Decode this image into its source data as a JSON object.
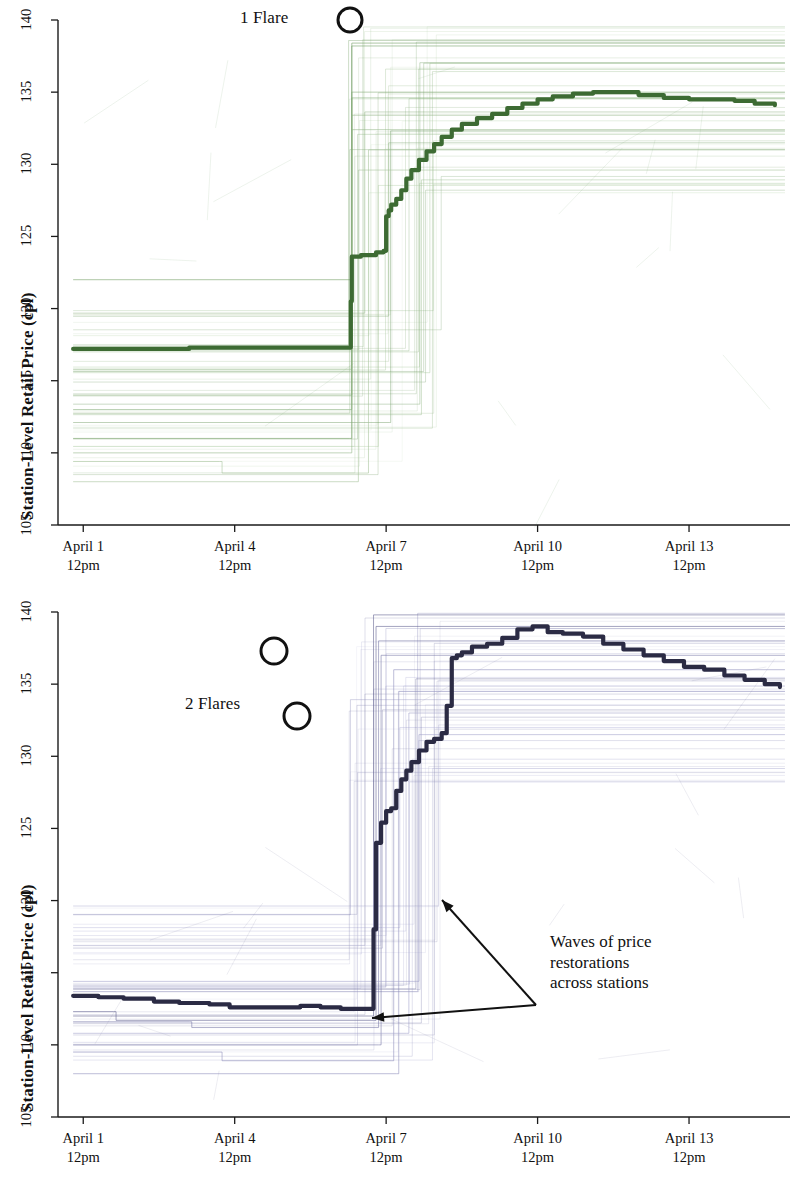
{
  "figure": {
    "background": "#ffffff",
    "panel_count": 2
  },
  "axis": {
    "y_label": "Station-Level Retail Price (cpl)",
    "y_ticks": [
      "105",
      "110",
      "115",
      "120",
      "125",
      "130",
      "135",
      "140"
    ],
    "x_ticks": [
      {
        "date": "April 1",
        "time": "12pm"
      },
      {
        "date": "April 4",
        "time": "12pm"
      },
      {
        "date": "April 7",
        "time": "12pm"
      },
      {
        "date": "April 10",
        "time": "12pm"
      },
      {
        "date": "April 13",
        "time": "12pm"
      }
    ]
  },
  "panel_top": {
    "annotation_flare": "1 Flare",
    "accent_color": "#3d6b33"
  },
  "panel_bottom": {
    "annotation_flare": "2 Flares",
    "annotation_waves_line1": "Waves of price",
    "annotation_waves_line2": "restorations",
    "annotation_waves_line3": "across stations",
    "accent_color": "#2b2b44"
  },
  "chart_data": [
    {
      "type": "line",
      "panel": "top",
      "title": "",
      "xlabel": "",
      "ylabel": "Station-Level Retail Price (cpl)",
      "ylim": [
        105,
        140
      ],
      "xlim": [
        0,
        14.5
      ],
      "x_tick_values": [
        0.5,
        3.5,
        6.5,
        9.5,
        12.5
      ],
      "x_tick_labels": [
        "April 1 12pm",
        "April 4 12pm",
        "April 7 12pm",
        "April 10 12pm",
        "April 13 12pm"
      ],
      "grid": false,
      "legend": null,
      "annotations": [
        {
          "text": "1 Flare",
          "x": 5.0,
          "y": 140.0
        },
        {
          "text": "flare-circle-marker",
          "x": 6.1,
          "y": 139.8
        }
      ],
      "series": [
        {
          "name": "Average station-level retail price (bold green)",
          "color": "#3d6b33",
          "x": [
            0.3,
            1.0,
            2.0,
            2.6,
            3.0,
            4.0,
            5.0,
            5.75,
            5.8,
            5.82,
            6.0,
            6.3,
            6.45,
            6.5,
            6.55,
            6.6,
            6.7,
            6.8,
            6.9,
            7.0,
            7.15,
            7.3,
            7.45,
            7.6,
            7.8,
            8.0,
            8.3,
            8.6,
            8.9,
            9.2,
            9.5,
            9.8,
            10.2,
            10.6,
            11.0,
            11.5,
            12.0,
            12.5,
            13.0,
            13.4,
            13.8,
            14.2
          ],
          "y": [
            117.2,
            117.2,
            117.2,
            117.3,
            117.3,
            117.3,
            117.3,
            117.3,
            120.5,
            123.6,
            123.7,
            123.9,
            124.0,
            126.4,
            126.8,
            127.2,
            127.6,
            128.2,
            129.0,
            129.6,
            130.3,
            130.9,
            131.4,
            131.9,
            132.4,
            132.8,
            133.2,
            133.5,
            133.9,
            134.2,
            134.5,
            134.7,
            134.9,
            135.0,
            135.0,
            134.8,
            134.6,
            134.5,
            134.5,
            134.4,
            134.2,
            134.1
          ]
        },
        {
          "name": "station spaghetti 1",
          "color": "#6b9a5c",
          "x": [
            0.3,
            5.78,
            5.82,
            14.4
          ],
          "y": [
            122.0,
            122.0,
            138.4,
            138.4
          ]
        },
        {
          "name": "station spaghetti 2",
          "color": "#6b9a5c",
          "x": [
            0.3,
            5.78,
            5.82,
            14.4
          ],
          "y": [
            111.0,
            111.0,
            138.2,
            138.2
          ]
        },
        {
          "name": "station spaghetti 3",
          "color": "#7fa872",
          "x": [
            0.3,
            5.78,
            5.82,
            14.4
          ],
          "y": [
            114.0,
            114.0,
            135.0,
            135.0
          ]
        },
        {
          "name": "station spaghetti 4",
          "color": "#7fa872",
          "x": [
            0.3,
            5.78,
            5.82,
            14.4
          ],
          "y": [
            113.0,
            113.0,
            134.6,
            134.6
          ]
        },
        {
          "name": "station spaghetti 5",
          "color": "#8fb382",
          "x": [
            0.3,
            5.78,
            5.82,
            14.4
          ],
          "y": [
            115.8,
            115.8,
            133.4,
            133.4
          ]
        },
        {
          "name": "station spaghetti 6",
          "color": "#8fb382",
          "x": [
            0.3,
            5.78,
            5.82,
            14.4
          ],
          "y": [
            110.0,
            110.0,
            132.4,
            132.4
          ]
        },
        {
          "name": "station spaghetti 7",
          "color": "#a3c097",
          "x": [
            0.3,
            3.2,
            3.25,
            6.1,
            6.15,
            14.4
          ],
          "y": [
            109.4,
            109.4,
            108.6,
            108.6,
            131.0,
            131.0
          ]
        },
        {
          "name": "station spaghetti 8",
          "color": "#a3c097",
          "x": [
            0.3,
            5.9,
            5.95,
            14.4
          ],
          "y": [
            108.0,
            108.0,
            129.6,
            129.6
          ]
        }
      ]
    },
    {
      "type": "line",
      "panel": "bottom",
      "title": "",
      "xlabel": "",
      "ylabel": "Station-Level Retail Price (cpl)",
      "ylim": [
        105,
        140
      ],
      "xlim": [
        0,
        14.5
      ],
      "x_tick_values": [
        0.5,
        3.5,
        6.5,
        9.5,
        12.5
      ],
      "x_tick_labels": [
        "April 1 12pm",
        "April 4 12pm",
        "April 7 12pm",
        "April 10 12pm",
        "April 13 12pm"
      ],
      "grid": false,
      "legend": null,
      "annotations": [
        {
          "text": "2 Flares",
          "x": 3.1,
          "y": 135.0
        },
        {
          "text": "flare-circle-marker-1",
          "x": 4.6,
          "y": 138.2
        },
        {
          "text": "flare-circle-marker-2",
          "x": 5.05,
          "y": 133.5
        },
        {
          "text": "Waves of price restorations across stations",
          "x": 9.2,
          "y": 116.0
        }
      ],
      "series": [
        {
          "name": "Average station-level retail price (bold navy)",
          "color": "#2b2b44",
          "x": [
            0.3,
            0.8,
            1.3,
            1.9,
            2.4,
            3.0,
            3.4,
            3.8,
            4.3,
            4.8,
            5.2,
            5.6,
            6.0,
            6.2,
            6.25,
            6.3,
            6.4,
            6.5,
            6.6,
            6.7,
            6.8,
            6.9,
            7.0,
            7.15,
            7.3,
            7.45,
            7.6,
            7.7,
            7.8,
            7.9,
            8.0,
            8.2,
            8.5,
            8.8,
            9.1,
            9.4,
            9.7,
            10.0,
            10.4,
            10.8,
            11.2,
            11.6,
            12.0,
            12.4,
            12.8,
            13.2,
            13.6,
            14.0,
            14.3
          ],
          "y": [
            113.4,
            113.3,
            113.2,
            113.0,
            112.9,
            112.8,
            112.6,
            112.6,
            112.6,
            112.7,
            112.6,
            112.5,
            112.5,
            112.5,
            118.0,
            124.0,
            125.4,
            126.2,
            126.4,
            127.6,
            128.4,
            129.0,
            129.6,
            130.4,
            131.0,
            131.2,
            131.6,
            133.5,
            136.8,
            137.0,
            137.2,
            137.6,
            137.8,
            138.2,
            138.8,
            139.0,
            138.6,
            138.5,
            138.3,
            137.8,
            137.4,
            137.0,
            136.6,
            136.2,
            136.0,
            135.6,
            135.3,
            135.0,
            134.8
          ]
        },
        {
          "name": "station spaghetti 1",
          "color": "#5a5a8c",
          "x": [
            0.3,
            6.2,
            6.25,
            14.4
          ],
          "y": [
            112.0,
            112.0,
            139.8,
            139.8
          ]
        },
        {
          "name": "station spaghetti 2",
          "color": "#5a5a8c",
          "x": [
            0.3,
            1.1,
            1.15,
            6.25,
            6.3,
            14.4
          ],
          "y": [
            112.3,
            112.3,
            111.7,
            111.7,
            139.0,
            139.0
          ]
        },
        {
          "name": "station spaghetti 3",
          "color": "#7272a3",
          "x": [
            0.3,
            2.6,
            2.65,
            6.3,
            6.35,
            14.4
          ],
          "y": [
            111.6,
            111.6,
            111.2,
            111.2,
            138.0,
            138.0
          ]
        },
        {
          "name": "station spaghetti 4",
          "color": "#7272a3",
          "x": [
            0.3,
            6.35,
            6.4,
            14.4
          ],
          "y": [
            110.0,
            110.0,
            137.0,
            137.0
          ]
        },
        {
          "name": "station spaghetti 5",
          "color": "#8a8ab8",
          "x": [
            0.3,
            3.2,
            3.25,
            6.6,
            6.65,
            14.4
          ],
          "y": [
            109.5,
            109.5,
            108.9,
            108.9,
            136.0,
            136.0
          ]
        },
        {
          "name": "station spaghetti 6",
          "color": "#8a8ab8",
          "x": [
            0.3,
            6.7,
            6.75,
            14.4
          ],
          "y": [
            108.0,
            108.0,
            134.5,
            134.5
          ]
        },
        {
          "name": "station spaghetti 7",
          "color": "#a0a0c8",
          "x": [
            0.3,
            6.9,
            6.95,
            14.4
          ],
          "y": [
            110.8,
            110.8,
            133.0,
            133.0
          ]
        },
        {
          "name": "station spaghetti 8",
          "color": "#a0a0c8",
          "x": [
            0.3,
            7.1,
            7.15,
            14.4
          ],
          "y": [
            114.4,
            114.4,
            131.5,
            131.5
          ]
        }
      ]
    }
  ]
}
